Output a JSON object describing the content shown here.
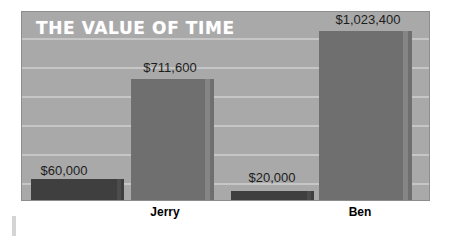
{
  "chart_data": {
    "type": "bar",
    "title": "THE VALUE OF TIME",
    "xlabel": "",
    "ylabel": "",
    "categories": [
      "Jerry",
      "Ben"
    ],
    "series": [
      {
        "name": "smaller-amount",
        "color": "#3f3f3f",
        "values": [
          60000,
          20000
        ],
        "labels": [
          "$60,000",
          "$20,000"
        ]
      },
      {
        "name": "larger-amount",
        "color": "#6f6f6f",
        "values": [
          711600,
          1023400
        ],
        "labels": [
          "$711,600",
          "$1,023,400"
        ]
      }
    ],
    "ylim": [
      0,
      1130000
    ],
    "grid": true,
    "gridlines": 6,
    "legend": "none",
    "background_color": "#a9a9a9",
    "gridline_color": "#c6c6c6",
    "title_color": "#ffffff",
    "label_color": "#1d1d1d"
  },
  "bars": [
    {
      "name": "jerry-small",
      "label": "$60,000",
      "category": "Jerry",
      "left_px": 9,
      "width_px": 93,
      "height_px": 21,
      "style": "dark"
    },
    {
      "name": "jerry-large",
      "label": "$711,600",
      "category": "Jerry",
      "left_px": 109,
      "width_px": 83,
      "height_px": 121,
      "style": "light"
    },
    {
      "name": "ben-small",
      "label": "$20,000",
      "category": "Ben",
      "left_px": 209,
      "width_px": 83,
      "height_px": 9,
      "style": "dark"
    },
    {
      "name": "ben-large",
      "label": "$1,023,400",
      "category": "Ben",
      "left_px": 297,
      "width_px": 93,
      "height_px": 169,
      "style": "light"
    }
  ],
  "gridline_positions_px": [
    26,
    55,
    84,
    113,
    142,
    171
  ],
  "value_labels": [
    {
      "text": "$60,000",
      "left_px": 24,
      "top_px": 163,
      "width_px": 80
    },
    {
      "text": "$711,600",
      "left_px": 125,
      "top_px": 60,
      "width_px": 90
    },
    {
      "text": "$20,000",
      "left_px": 232,
      "top_px": 170,
      "width_px": 80
    },
    {
      "text": "$1,023,400",
      "left_px": 318,
      "top_px": 12,
      "width_px": 100
    }
  ],
  "category_labels": [
    {
      "text": "Jerry",
      "left_px": 125,
      "width_px": 80
    },
    {
      "text": "Ben",
      "left_px": 320,
      "width_px": 80
    }
  ]
}
